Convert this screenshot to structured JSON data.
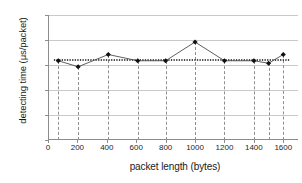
{
  "chart_data": {
    "type": "line",
    "title": "",
    "xlabel": "packet length (bytes)",
    "ylabel": "detecting time (μs/packet)",
    "xlim": [
      0,
      1700
    ],
    "ylim": [
      13,
      18
    ],
    "xticks": [
      0,
      200,
      400,
      600,
      800,
      1000,
      1200,
      1400,
      1600
    ],
    "yticks": [
      13,
      14,
      15,
      16,
      17,
      18
    ],
    "grid": "horizontal",
    "legend": "none",
    "marker": "diamond",
    "series": [
      {
        "name": "detecting time",
        "x": [
          70,
          205,
          410,
          610,
          800,
          1000,
          1200,
          1400,
          1500,
          1600
        ],
        "values": [
          16.17,
          15.93,
          16.42,
          16.17,
          16.17,
          16.92,
          16.17,
          16.17,
          16.07,
          16.42
        ]
      },
      {
        "name": "trendline",
        "style": "dotted-horizontal",
        "x": [
          40,
          1640
        ],
        "values": [
          16.2,
          16.2
        ]
      }
    ],
    "droplines": [
      70,
      205,
      410,
      610,
      800,
      1000,
      1200,
      1400,
      1500,
      1600
    ],
    "colors": {
      "line": "#4d4d4d",
      "marker": "#111111",
      "grid": "#c9c9c9",
      "axis": "#8c8c8c",
      "dropline": "#8f8f8f",
      "background": "#ffffff",
      "text": "#262626"
    }
  },
  "ytick_labels": [
    "18",
    "17",
    "16",
    "15",
    "14",
    "13"
  ],
  "xtick_labels": [
    "0",
    "200",
    "400",
    "600",
    "800",
    "1000",
    "1200",
    "1400",
    "1600"
  ]
}
